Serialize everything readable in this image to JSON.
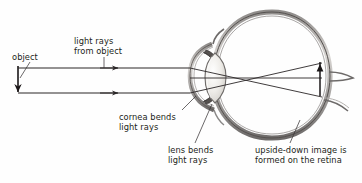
{
  "diagram": {
    "type": "optics-eye-ray-diagram",
    "background_color": "#fefefe",
    "ink_color": "#231f20",
    "labels": {
      "object": "object",
      "light_rays_from_object": "light rays\nfrom object",
      "cornea_bends_light_rays": "cornea bends\nlight rays",
      "lens_bends_light_rays": "lens bends\nlight rays",
      "upside_down_image": "upside-down image is\nformed on the retina"
    },
    "parts": {
      "eyeball": "eyeball-outline",
      "cornea": "cornea",
      "lens": "lens",
      "retina": "retina",
      "optic_nerve": "optic-nerve",
      "object_arrow": "object-arrow",
      "image_arrow": "inverted-image-arrow",
      "upper_ray": "upper-light-ray",
      "lower_ray": "lower-light-ray"
    },
    "colors": {
      "eye_wall": "#6d6a69",
      "eye_wall_light": "#c9c6c4",
      "lens_fill": "#ebe9e5",
      "lens_stroke": "#6f6c6a",
      "ray": "#2a2627",
      "leader": "#3b3738"
    }
  }
}
